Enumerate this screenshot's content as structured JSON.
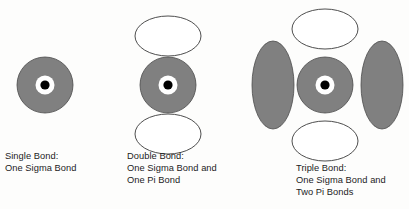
{
  "figure": {
    "background_color": "#fdfdfc",
    "orbital_fill_color": "#808080",
    "orbital_stroke_color": "#3a3a3a",
    "pi_orbital_fill_color": "#ffffff",
    "nucleus_color": "#000000",
    "nucleus_ring_color": "#ffffff"
  },
  "diagrams": [
    {
      "id": "single-bond",
      "caption_lines": [
        "Single Bond:",
        "One Sigma Bond"
      ],
      "sigma": {
        "cx": 45,
        "cy": 85,
        "r": 28
      },
      "nucleus": {
        "cx": 45,
        "cy": 85,
        "ring_r": 9.5,
        "dot_r": 4.6
      },
      "pi_orbitals": []
    },
    {
      "id": "double-bond",
      "caption_lines": [
        "Double Bond:",
        "One Sigma Bond and",
        "One Pi Bond"
      ],
      "sigma": {
        "cx": 168,
        "cy": 85,
        "r": 28
      },
      "nucleus": {
        "cx": 168,
        "cy": 85,
        "ring_r": 9.5,
        "dot_r": 4.6
      },
      "pi_orbitals": [
        {
          "cx": 168,
          "cy": 36,
          "rx": 33,
          "ry": 20,
          "position": "top"
        },
        {
          "cx": 168,
          "cy": 134,
          "rx": 33,
          "ry": 20,
          "position": "bottom"
        }
      ]
    },
    {
      "id": "triple-bond",
      "caption_lines": [
        "Triple Bond:",
        "One Sigma Bond and",
        "Two Pi Bonds"
      ],
      "sigma": {
        "cx": 325,
        "cy": 85,
        "r": 28
      },
      "nucleus": {
        "cx": 325,
        "cy": 85,
        "ring_r": 9.5,
        "dot_r": 4.6
      },
      "pi_orbitals": [
        {
          "cx": 325,
          "cy": 29,
          "rx": 33,
          "ry": 20,
          "position": "top"
        },
        {
          "cx": 325,
          "cy": 141,
          "rx": 33,
          "ry": 20,
          "position": "bottom"
        }
      ],
      "pi_lobes_filled": [
        {
          "cx": 273,
          "cy": 85,
          "rx": 21,
          "ry": 44,
          "position": "left"
        },
        {
          "cx": 382,
          "cy": 85,
          "rx": 21,
          "ry": 44,
          "position": "right"
        }
      ]
    }
  ]
}
